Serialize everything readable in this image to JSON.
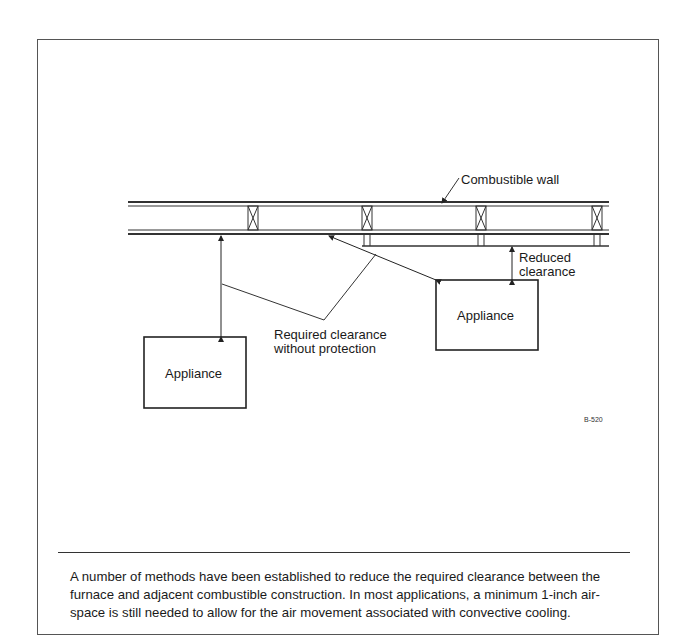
{
  "figure": {
    "labels": {
      "combustible_wall": "Combustible wall",
      "reduced_clearance_line1": "Reduced",
      "reduced_clearance_line2": "clearance",
      "required_clearance_line1": "Required clearance",
      "required_clearance_line2": "without protection",
      "appliance_left": "Appliance",
      "appliance_right": "Appliance"
    },
    "figure_id": "B-520"
  },
  "caption": {
    "lines": [
      "A number of methods have been established to reduce the required clearance between the",
      "furnace and adjacent combustible construction. In most applications, a minimum 1-inch air-",
      "space is still needed to allow for the air movement associated with convective cooling."
    ]
  }
}
